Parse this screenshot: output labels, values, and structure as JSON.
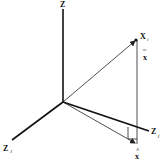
{
  "diagram": {
    "type": "3d-vector-projection",
    "axes": {
      "vertical": {
        "label": "Z",
        "subscript": ""
      },
      "left": {
        "label": "Z",
        "subscript": "1"
      },
      "right": {
        "label": "Z",
        "subscript": "j"
      }
    },
    "point": {
      "label": "X",
      "subscript": "i"
    },
    "residual": {
      "label": "x",
      "accent": "~"
    },
    "projection": {
      "label": "x",
      "accent": "^"
    },
    "colors": {
      "line": "#222222",
      "thick_axis": "#111111",
      "background": "#ffffff"
    }
  }
}
